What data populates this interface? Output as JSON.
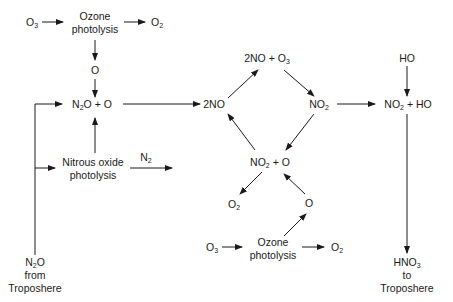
{
  "diagram": {
    "type": "reaction-flow",
    "nodes": {
      "o3_top": {
        "main": "O",
        "sub": "3"
      },
      "ozone_photolysis_top": {
        "line1": "Ozone",
        "line2": "photolysis"
      },
      "o2_top": {
        "main": "O",
        "sub": "2"
      },
      "o_top": {
        "text": "O"
      },
      "n2o_plus_o": {
        "a": "N",
        "a_sub": "2",
        "b": "O + O"
      },
      "nitrous_oxide_photolysis": {
        "line1": "Nitrous oxide",
        "line2": "photolysis"
      },
      "n2": {
        "main": "N",
        "sub": "2"
      },
      "n2o_from_troposphere": {
        "a": "N",
        "a_sub": "2",
        "b": "O",
        "line2": "from",
        "line3": "Troposhere"
      },
      "two_no": {
        "text": "2NO"
      },
      "two_no_plus_o3": {
        "a": "2NO + O",
        "a_sub": "3"
      },
      "no2_right": {
        "main": "NO",
        "sub": "2"
      },
      "no2_plus_o": {
        "a": "NO",
        "a_sub": "2",
        "b": " + O"
      },
      "o2_mid": {
        "main": "O",
        "sub": "2"
      },
      "o_mid": {
        "text": "O"
      },
      "o3_bottom": {
        "main": "O",
        "sub": "3"
      },
      "ozone_photolysis_bottom": {
        "line1": "Ozone",
        "line2": "photolysis"
      },
      "o2_bottom": {
        "main": "O",
        "sub": "2"
      },
      "ho": {
        "text": "HO"
      },
      "no2_plus_ho": {
        "a": "NO",
        "a_sub": "2",
        "b": " + HO"
      },
      "hno3_to_troposphere": {
        "a": "HNO",
        "a_sub": "3",
        "line2": "to",
        "line3": "Troposhere"
      }
    },
    "edges": [
      [
        "o3_top",
        "ozone_photolysis_top"
      ],
      [
        "ozone_photolysis_top",
        "o2_top"
      ],
      [
        "ozone_photolysis_top",
        "o_top"
      ],
      [
        "o_top",
        "n2o_plus_o"
      ],
      [
        "n2o_from_troposphere",
        "n2o_plus_o"
      ],
      [
        "n2o_from_troposphere",
        "nitrous_oxide_photolysis"
      ],
      [
        "nitrous_oxide_photolysis",
        "n2o_plus_o"
      ],
      [
        "nitrous_oxide_photolysis",
        "n2"
      ],
      [
        "n2o_plus_o",
        "two_no"
      ],
      [
        "two_no",
        "two_no_plus_o3"
      ],
      [
        "two_no_plus_o3",
        "no2_right"
      ],
      [
        "no2_right",
        "no2_plus_o"
      ],
      [
        "no2_plus_o",
        "two_no"
      ],
      [
        "no2_plus_o",
        "o2_mid"
      ],
      [
        "o_mid",
        "no2_plus_o"
      ],
      [
        "ozone_photolysis_bottom",
        "o_mid"
      ],
      [
        "o3_bottom",
        "ozone_photolysis_bottom"
      ],
      [
        "ozone_photolysis_bottom",
        "o2_bottom"
      ],
      [
        "no2_right",
        "no2_plus_ho"
      ],
      [
        "ho",
        "no2_plus_ho"
      ],
      [
        "no2_plus_ho",
        "hno3_to_troposphere"
      ]
    ],
    "colors": {
      "line": "#1a1a1a",
      "background": "#ffffff"
    }
  }
}
